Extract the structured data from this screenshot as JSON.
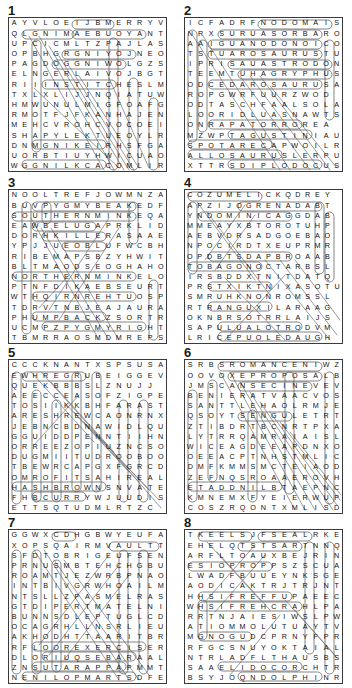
{
  "page": {
    "puzzle_count": 8,
    "grid_rows": 16,
    "grid_cols": 16,
    "ink_color": "#111111",
    "border_color": "#3a3a3a",
    "highlight_color": "#9a9a9a"
  },
  "puzzles": [
    {
      "number": "1",
      "theme": "Knitting / Crafts",
      "rows": [
        "AYVLOEIJBMERRYV",
        "QLGNIMAEBUOYANT",
        "UPCICMLTZPAJLAS",
        "OPBHGRGNIYOJNEO",
        "PAGDOGGNIWOLGZS",
        "ELNGERLAIVOJBGT",
        "RIIINSTITCHESLM",
        "TXLXLIJJNQIATUW",
        "HMWUNULMIGFOAFG",
        "RMOTFJFKANHAJEN",
        "MEHCVROHCVOCOEI",
        "SHAPYLEKTUEOYLR",
        "DNMGNIKEIRHSFGA",
        "UORBTIUYHWICUAO",
        "WGGNILKCACOMLIR"
      ]
    },
    {
      "number": "2",
      "theme": "Dinosaurs",
      "rows": [
        "ICFADRFNODOMAIS",
        "NRXSURUASORBARO",
        "AAIGUANODONOICO",
        "TSTUAROSAURUSTU",
        "IPRISAUASTRODON",
        "TEEMTUHAGRYPHUS",
        "ODCEDAROSAURUSA",
        "ROPGWRFUURZWOD",
        "ODTASCHFAALSOLA",
        "LOORIDLUASNAWTS",
        "ONRAPATORROREA",
        "MZWPTAGUSTINIAU",
        "SPOTARECAPWOILR",
        "ALLOSAURUSLERPU",
        "XTTRSDIPLODOCUS"
      ]
    },
    {
      "number": "3",
      "theme": "Whales",
      "rows": [
        "NOOLTREFJOWMNZA",
        "BUVPYGMYBEAKEDF",
        "SOUTHERNMINKEQA",
        "EAWBELUGAPRKLID",
        "DORHKILLERASAAE",
        "YPJJUEOBLUFWCBH",
        "RIBEMAPSBZYHWIT",
        "BLTMAODSEOGHAHO",
        "NORTHERNMINKELO",
        "PTNFDIKAEBSEURT",
        "WTHQIRNREHTUOSP",
        "TDRVTNBJEAJAURA",
        "PHUMPBACKZSORTR",
        "UCMPZPYGMYRIGHT",
        "TBMRRAOSMDMREPS"
      ]
    },
    {
      "number": "4",
      "theme": "Caribbean Islands",
      "rows": [
        "COZUMELICKQDREY",
        "APZIJOGRENADABT",
        "YNDOMINICAGGDAB",
        "MMEAYXBTOROTUHP",
        "AEBVDRSADGOEBAO",
        "NPOCIRDTXEUPRMR",
        "OPDBTSDAPBROAAB",
        "TOBAGONOCTARBSL",
        "IRSBDDXTNITDATQ",
        "PRSTXIKTNIXASOTU",
        "SMRUHKNONROMSSL",
        "RTRANGUXILARAAG",
        "OKNBRSOTRRLAIJS",
        "SAPULUALOTRODVM",
        "LRICEPUOLEDAUGH"
      ]
    },
    {
      "number": "5",
      "theme": "Breakfast Foods",
      "rows": [
        "CCCKNANTXSPSUSA",
        "EWHREGRUBEIGGEV",
        "QUEKBBBSLZNUJJ",
        "AEECCEASOFZIGPE",
        "TOSIIKKBHFARAST",
        "ARESHREWCAONRNX",
        "JEBNCBDNAWIDLQU",
        "GGUIDDPENNTIIHN",
        "ORREEZOPIUZNCSO",
        "DUGMIITUDROOBOO",
        "TBEWRCAPGXFGRCD",
        "OMROFITSAHIREAL",
        "HASHBROWNSNVATE",
        "FHBCURRYWJUUDIS",
        "ETTSQTUDMLRTZC"
      ]
    },
    {
      "number": "6",
      "theme": "Romance / Wedding",
      "rows": [
        "SRBSROMANCENIWZ",
        "OOVOXEPROPOSALB",
        "JMSCANSECINEVEV",
        "BENIERATVAACVOS",
        "SANTTLEHAOLRMJE",
        "QSOYTSENGULETRT",
        "ZTIBDRTBCNRTPXA",
        "LYTRRQAMRAIAISL",
        "WICEAGDEEAPDNXO",
        "OEEACPTNHSTMLIC",
        "DMFKMMSMCTEIAOD",
        "ZEFNQSROAAEROVH",
        "ETADDNILBTAEPNC",
        "KMNEMXFYEIERWUP",
        "COSZRQONTXMLISD"
      ]
    },
    {
      "number": "7",
      "theme": "Gymnastics",
      "rows": [
        "GGWXCDHGBWYEUFA",
        "XOPSQAIRMVAULTT",
        "SFDTOBRIGEUFSEN",
        "PRNUSMBTEHCHGBU",
        "ROAMTJEZWRBPNAO",
        "INTBIVGRWHOAILM",
        "NTSLLZPASMELRAS",
        "GTDIPERTMATELNI",
        "BUNNSDLEPTUGLCD",
        "OCAGRHLLNSRLIEU",
        "AKHODHTTAARITBR",
        "RFLOOREXERCISER",
        "DLORIUQSEBARAAL",
        "ZNSUTARAPPAPMMT",
        "NENILOPMARTSDFE"
      ]
    },
    {
      "number": "8",
      "theme": "Sea Creatures",
      "rows": [
        "TKEELSJFSEALRKE",
        "EHELQTSTSARTNNQ",
        "ARFLTOAUXBEJRIN",
        "ESIOPROPPSZSCUA",
        "LWADFBUUEYNKSGE",
        "AODICAKTRJTRJNT",
        "HHSIFREFFUPAEEC",
        "WHSIFREHCRAHLPA",
        "RRTNJAIESIWSLPW",
        "ATIOMMOLUTUAYTV",
        "MGNOGUDCPRNYFPR",
        "RFGCSNUYOKTAIAL",
        "NTRLADFLTHAUSBS",
        "SAAELIDOCORCHTR",
        "BSYJOQNDOLPHINR"
      ]
    }
  ]
}
